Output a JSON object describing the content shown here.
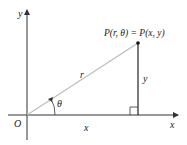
{
  "diagram": {
    "axes": {
      "x_label": "x",
      "y_label": "y",
      "origin_label": "O"
    },
    "point": {
      "label": "P(r, θ) = P(x, y)"
    },
    "segments": {
      "radius_label": "r",
      "vertical_label": "y",
      "horizontal_label": "x"
    },
    "angle": {
      "label": "θ"
    },
    "colors": {
      "axes": "#333333",
      "radius_line": "#bdbdbd",
      "vertical_line": "#222222",
      "text": "#222222"
    }
  }
}
